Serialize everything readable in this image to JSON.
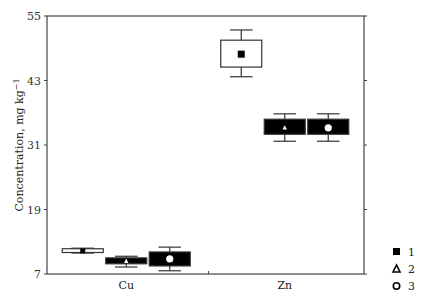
{
  "chart_data": {
    "type": "box",
    "title": "",
    "xlabel": "",
    "ylabel": "Concentration, mg kg⁻¹",
    "ylim": [
      7,
      55
    ],
    "yticks": [
      7,
      19,
      31,
      43,
      55
    ],
    "grid": false,
    "legend_position": "right-bottom",
    "categories": [
      "Cu",
      "Zn"
    ],
    "legend": [
      {
        "id": "1",
        "label": "1",
        "marker": "filled-square"
      },
      {
        "id": "2",
        "label": "2",
        "marker": "triangle"
      },
      {
        "id": "3",
        "label": "3",
        "marker": "circle"
      }
    ],
    "series": [
      {
        "name": "1",
        "marker": "filled-square",
        "box_fill": "#ffffff",
        "values": [
          {
            "category": "Cu",
            "center": 11.3,
            "box_low": 11.0,
            "box_high": 11.7,
            "whisker_low": 10.9,
            "whisker_high": 11.8
          },
          {
            "category": "Zn",
            "center": 47.9,
            "box_low": 45.5,
            "box_high": 50.5,
            "whisker_low": 43.7,
            "whisker_high": 52.4
          }
        ]
      },
      {
        "name": "2",
        "marker": "triangle",
        "box_fill": "#000000",
        "values": [
          {
            "category": "Cu",
            "center": 9.4,
            "box_low": 8.9,
            "box_high": 10.0,
            "whisker_low": 8.3,
            "whisker_high": 10.3
          },
          {
            "category": "Zn",
            "center": 34.2,
            "box_low": 33.0,
            "box_high": 35.8,
            "whisker_low": 31.7,
            "whisker_high": 36.8
          }
        ]
      },
      {
        "name": "3",
        "marker": "circle",
        "box_fill": "#000000",
        "values": [
          {
            "category": "Cu",
            "center": 9.8,
            "box_low": 8.5,
            "box_high": 11.1,
            "whisker_low": 7.6,
            "whisker_high": 12.0
          },
          {
            "category": "Zn",
            "center": 34.2,
            "box_low": 33.0,
            "box_high": 35.8,
            "whisker_low": 31.7,
            "whisker_high": 36.8
          }
        ]
      }
    ]
  }
}
